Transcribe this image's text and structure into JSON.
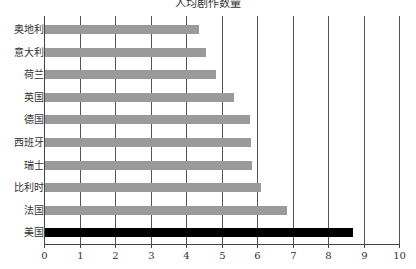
{
  "chart_data": {
    "type": "bar",
    "orientation": "horizontal",
    "title": "人均剧作数量",
    "xlabel": "",
    "ylabel": "",
    "categories": [
      "奥地利",
      "意大利",
      "荷兰",
      "英国",
      "德国",
      "西班牙",
      "瑞士",
      "比利时",
      "法国",
      "美国"
    ],
    "values": [
      4.37,
      4.56,
      4.84,
      5.35,
      5.8,
      5.83,
      5.86,
      6.11,
      6.84,
      8.7
    ],
    "highlight": "美国",
    "xlim": [
      0,
      10
    ],
    "xticks": [
      "0",
      "1",
      "2",
      "3",
      "4",
      "5",
      "6",
      "7",
      "8",
      "9",
      "10"
    ],
    "grid": {
      "vertical": true,
      "horizontal": false
    },
    "legend": null
  },
  "colors": {
    "bar": "#9a9a9a",
    "highlight": "#000000",
    "grid": "#555555"
  }
}
